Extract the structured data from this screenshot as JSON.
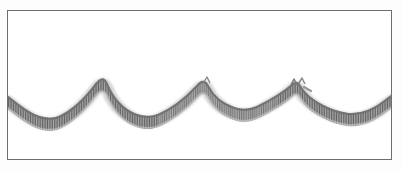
{
  "figure": {
    "title": "",
    "caption": "",
    "background_color": "#ffffff",
    "frame": {
      "name": "rectangular-border",
      "stroke_color": "#6e6e72",
      "stroke_width_px": 1,
      "x": 7,
      "y": 10,
      "width": 385,
      "height": 150
    },
    "curve": {
      "name": "scalloped-festoon-curve",
      "description": "thick hand-drawn catenary festoon / scalloped wave with fine vertical hatch shading",
      "stroke_color_dark": "#6f6f6f",
      "stroke_color_mid": "#949494",
      "stroke_color_light": "#bcbcbc",
      "hatch_color": "#8a8a8a",
      "band_thickness_px": 9,
      "arch_count": 4,
      "cusp_count": 3
    }
  },
  "chart_data": {
    "type": "line",
    "title": "",
    "xlabel": "",
    "ylabel": "",
    "xlim": [
      0,
      402
    ],
    "ylim": [
      170,
      0
    ],
    "grid": false,
    "legend": null,
    "annotations": [
      {
        "label": "left-edge-start",
        "x": 7,
        "y": 95
      },
      {
        "label": "trough-1",
        "x": 58,
        "y": 115
      },
      {
        "label": "cusp-peak-1",
        "x": 106,
        "y": 82
      },
      {
        "label": "trough-2",
        "x": 157,
        "y": 113
      },
      {
        "label": "cusp-peak-2",
        "x": 203,
        "y": 85
      },
      {
        "label": "trough-3",
        "x": 250,
        "y": 107
      },
      {
        "label": "cusp-peak-3-notched",
        "x": 296,
        "y": 87
      },
      {
        "label": "trough-4",
        "x": 345,
        "y": 113
      },
      {
        "label": "right-edge-end",
        "x": 392,
        "y": 94
      }
    ],
    "series": [
      {
        "name": "festoon-centerline",
        "x": [
          7,
          18,
          30,
          42,
          52,
          58,
          66,
          76,
          86,
          95,
          101,
          106,
          112,
          120,
          130,
          142,
          152,
          157,
          165,
          175,
          186,
          196,
          201,
          203,
          208,
          216,
          226,
          238,
          248,
          250,
          258,
          268,
          278,
          288,
          293,
          296,
          300,
          306,
          316,
          328,
          338,
          345,
          352,
          362,
          374,
          384,
          392
        ],
        "y": [
          95,
          101,
          108,
          113,
          115,
          115,
          114,
          110,
          102,
          91,
          85,
          82,
          84,
          90,
          98,
          106,
          111,
          113,
          113,
          110,
          102,
          91,
          86,
          85,
          88,
          94,
          101,
          106,
          107,
          107,
          106,
          103,
          98,
          91,
          88,
          87,
          90,
          95,
          103,
          109,
          112,
          113,
          112,
          108,
          102,
          97,
          94
        ]
      }
    ]
  }
}
